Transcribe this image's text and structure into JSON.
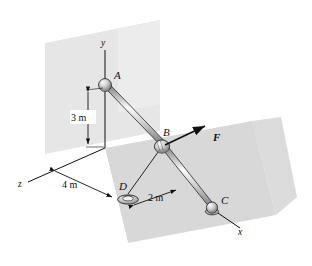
{
  "figure": {
    "type": "engineering-statics-diagram",
    "background_color": "#ffffff",
    "plane_fill": "#d9d9d9",
    "wall_fill": "#e4e4e4",
    "line_color": "#101010",
    "rod_light": "#f2f2f2",
    "rod_mid": "#b9b9b9",
    "rod_dark": "#6e6e6e"
  },
  "axes": [
    {
      "name": "y-axis",
      "label": "y"
    },
    {
      "name": "z-axis",
      "label": "z"
    },
    {
      "name": "x-axis",
      "label": "x"
    }
  ],
  "points": [
    {
      "name": "point-a",
      "label": "A",
      "joint": "ball-and-socket"
    },
    {
      "name": "point-b",
      "label": "B",
      "joint": "collar"
    },
    {
      "name": "point-c",
      "label": "C",
      "joint": "ball-and-socket"
    },
    {
      "name": "point-d",
      "label": "D",
      "joint": "eyebolt-anchor"
    }
  ],
  "force": {
    "name": "force-f",
    "label": "F"
  },
  "dimensions": [
    {
      "name": "dimension-3m",
      "label": "3 m",
      "axis": "vertical"
    },
    {
      "name": "dimension-4m",
      "label": "4 m",
      "axis": "depth"
    },
    {
      "name": "dimension-2m",
      "label": "2 m",
      "axis": "ground"
    }
  ]
}
